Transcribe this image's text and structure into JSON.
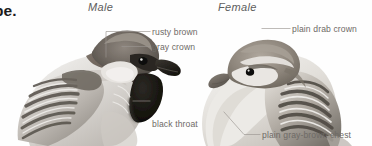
{
  "plate": {
    "background_color": "#fefefe",
    "label_color": "#6e6a66",
    "leader_color": "#9a9691",
    "header_color": "#5d5d5d",
    "bleed_text": "be."
  },
  "headers": [
    {
      "key": "male",
      "label": "Male"
    },
    {
      "key": "female",
      "label": "Female"
    }
  ],
  "callouts": {
    "male": [
      {
        "key": "rusty_brown",
        "label": "rusty brown"
      },
      {
        "key": "gray_crown",
        "label": "gray crown"
      },
      {
        "key": "black_throat",
        "line1": "black throat",
        "line2": "and chest"
      }
    ],
    "female": [
      {
        "key": "plain_drab_crown",
        "label": "plain drab crown"
      },
      {
        "key": "plain_chest",
        "label": "plain gray-brown chest"
      }
    ]
  },
  "figures": [
    {
      "key": "male-sparrow",
      "name": "male house sparrow illustration"
    },
    {
      "key": "female-sparrow",
      "name": "female house sparrow illustration"
    }
  ]
}
